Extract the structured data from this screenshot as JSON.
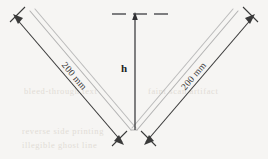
{
  "figure": {
    "background_color": "#f6f5f3",
    "rod_color": "#b4b4b4",
    "dimension_color": "#3a3a3a",
    "ghost_text_color": "#ded9d2"
  },
  "labels": {
    "left_length": "200 mm",
    "right_length": "200 mm",
    "height": "h"
  },
  "geometry": {
    "vertex": {
      "x": 134,
      "y": 131
    },
    "left_tip": {
      "x": 28,
      "y": 15
    },
    "right_tip": {
      "x": 240,
      "y": 15
    },
    "height_line_x": 135,
    "height_top_y": 14,
    "dashed_line_y": 14,
    "included_angle_deg": 90,
    "arm_length_mm": 200
  },
  "annotations": {
    "dashed_reference": "horizontal-dashed-datum",
    "height_arrow": "vertical-height-arrow",
    "left_dimension": "left-arm-dimension-line",
    "right_dimension": "right-arm-dimension-line"
  },
  "ghost_text": {
    "line1": "bleed-through text",
    "line2": "faint scan artifact",
    "line3": "reverse side printing",
    "line4": "illegible ghost line"
  }
}
